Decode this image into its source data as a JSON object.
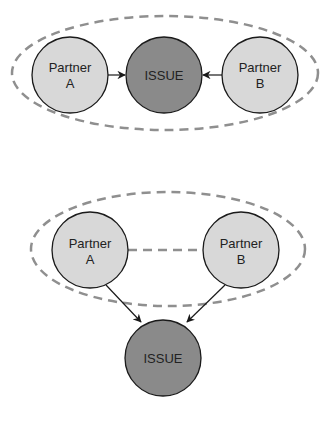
{
  "colors": {
    "partner_fill": "#d8d8d8",
    "issue_fill": "#8a8a8a",
    "stroke": "#1a1a1a",
    "dash": "#8f8f8f"
  },
  "diagrams": [
    {
      "name": "issue-between-partners",
      "nodes": {
        "partner_a": {
          "line1": "Partner",
          "line2": "A"
        },
        "issue": {
          "label": "ISSUE"
        },
        "partner_b": {
          "line1": "Partner",
          "line2": "B"
        }
      }
    },
    {
      "name": "partners-together-facing-issue",
      "nodes": {
        "partner_a": {
          "line1": "Partner",
          "line2": "A"
        },
        "partner_b": {
          "line1": "Partner",
          "line2": "B"
        },
        "issue": {
          "label": "ISSUE"
        }
      }
    }
  ]
}
